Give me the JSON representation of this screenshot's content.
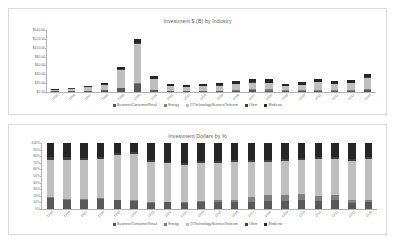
{
  "charts": [
    {
      "id": "investment-by-industry",
      "title": "Investment $ (B) by Industry"
    },
    {
      "id": "investment-dollars-by-percent",
      "title": "Investment Dollars by %"
    }
  ],
  "legend": {
    "items": [
      {
        "label": "Business/Consumer/Retail",
        "color": "#595959"
      },
      {
        "label": "Energy",
        "color": "#7f7f7f"
      },
      {
        "label": "IT/Technology/Science/Telecom",
        "color": "#bfbfbf"
      },
      {
        "label": "Other",
        "color": "#404040"
      },
      {
        "label": "Medicine",
        "color": "#262626"
      }
    ]
  },
  "chart_data": [
    {
      "type": "bar",
      "title": "Investment $ (B) by Industry",
      "subtitle": "",
      "xlabel": "",
      "ylabel": "",
      "stacked": true,
      "grid": false,
      "legend_position": "bottom",
      "ylim": [
        0,
        140
      ],
      "yticks": [
        0,
        20,
        40,
        60,
        80,
        100,
        120,
        140
      ],
      "ytick_labels": [
        "$0.00",
        "$20.00",
        "$40.00",
        "$60.00",
        "$80.00",
        "$100.00",
        "$120.00",
        "$140.00"
      ],
      "categories": [
        "1995",
        "1996",
        "1997",
        "1998",
        "1999",
        "2000",
        "2001",
        "2002",
        "2003",
        "2004",
        "2005",
        "2006",
        "2007",
        "2008",
        "2009",
        "2010",
        "2011",
        "2012",
        "2013",
        "2014"
      ],
      "series": [
        {
          "name": "Business/Consumer/Retail",
          "color": "#595959",
          "values": [
            1.2,
            1.8,
            2.4,
            3.6,
            9.0,
            19.0,
            4.6,
            2.6,
            2.1,
            2.4,
            2.6,
            3.1,
            3.6,
            3.3,
            2.0,
            2.5,
            3.3,
            3.1,
            3.4,
            5.0
          ]
        },
        {
          "name": "Energy",
          "color": "#7f7f7f",
          "values": [
            0.1,
            0.1,
            0.2,
            0.2,
            0.4,
            0.8,
            0.4,
            0.3,
            0.3,
            0.4,
            0.7,
            1.3,
            2.2,
            2.8,
            1.6,
            2.0,
            2.3,
            1.6,
            1.4,
            1.6
          ]
        },
        {
          "name": "IT/Technology/Science/Telecom",
          "color": "#bfbfbf",
          "values": [
            4.0,
            6.0,
            8.4,
            12.5,
            40.0,
            88.0,
            24.0,
            9.8,
            8.0,
            10.0,
            11.0,
            13.0,
            15.5,
            14.5,
            9.0,
            11.5,
            16.0,
            13.0,
            15.0,
            26.0
          ]
        },
        {
          "name": "Other",
          "color": "#404040",
          "values": [
            0.3,
            0.4,
            0.5,
            0.7,
            1.6,
            3.2,
            1.1,
            0.6,
            0.5,
            0.6,
            0.7,
            0.8,
            1.0,
            0.9,
            0.6,
            0.7,
            0.9,
            0.8,
            0.9,
            1.3
          ]
        },
        {
          "name": "Medicine",
          "color": "#262626",
          "values": [
            1.4,
            1.9,
            2.5,
            3.4,
            6.0,
            9.5,
            6.2,
            5.3,
            5.1,
            5.6,
            6.0,
            6.6,
            7.5,
            7.2,
            5.2,
            5.8,
            6.4,
            6.0,
            6.5,
            8.0
          ]
        }
      ]
    },
    {
      "type": "bar",
      "title": "Investment Dollars by %",
      "subtitle": "",
      "xlabel": "",
      "ylabel": "",
      "stacked": true,
      "normalized": true,
      "grid": false,
      "legend_position": "bottom",
      "ylim": [
        0,
        100
      ],
      "yticks": [
        0,
        10,
        20,
        30,
        40,
        50,
        60,
        70,
        80,
        90,
        100
      ],
      "ytick_labels": [
        "0%",
        "10%",
        "20%",
        "30%",
        "40%",
        "50%",
        "60%",
        "70%",
        "80%",
        "90%",
        "100%"
      ],
      "categories": [
        "1995",
        "1996",
        "1997",
        "1998",
        "1999",
        "2000",
        "2001",
        "2002",
        "2003",
        "2004",
        "2005",
        "2006",
        "2007",
        "2008",
        "2009",
        "2010",
        "2011",
        "2012",
        "2013",
        "2014"
      ],
      "series": [
        {
          "name": "Business/Consumer/Retail",
          "color": "#595959",
          "values": [
            17,
            14,
            14,
            15,
            13,
            12,
            9,
            10,
            9,
            10,
            10,
            10,
            11,
            12,
            12,
            13,
            12,
            14,
            9,
            10
          ]
        },
        {
          "name": "Energy",
          "color": "#7f7f7f",
          "values": [
            1,
            1,
            1,
            1,
            1,
            1,
            1,
            1,
            1,
            2,
            3,
            4,
            7,
            10,
            10,
            10,
            8,
            7,
            4,
            4
          ]
        },
        {
          "name": "IT/Technology/Science/Telecom",
          "color": "#bfbfbf",
          "values": [
            57,
            60,
            60,
            60,
            68,
            71,
            62,
            58,
            57,
            58,
            57,
            57,
            54,
            50,
            51,
            52,
            56,
            55,
            60,
            62
          ]
        },
        {
          "name": "Other",
          "color": "#404040",
          "values": [
            4,
            4,
            3,
            3,
            3,
            3,
            3,
            3,
            3,
            3,
            3,
            3,
            3,
            3,
            3,
            3,
            3,
            3,
            3,
            3
          ]
        },
        {
          "name": "Medicine",
          "color": "#262626",
          "values": [
            21,
            21,
            22,
            21,
            15,
            13,
            25,
            28,
            30,
            27,
            27,
            26,
            25,
            25,
            24,
            22,
            21,
            21,
            24,
            21
          ]
        }
      ]
    }
  ]
}
